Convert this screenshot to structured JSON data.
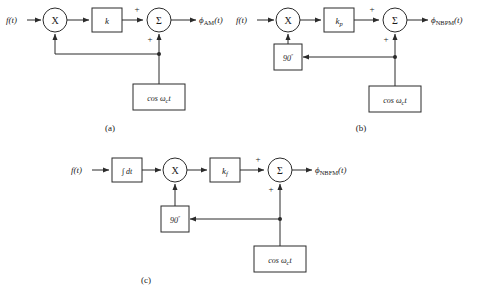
{
  "figure": {
    "type": "block-diagram-set",
    "stroke_color": "#2b2b2b",
    "background_color": "#ffffff"
  },
  "panels": [
    {
      "id": "a",
      "caption": "(a)",
      "name": "AM modulator",
      "input_label": "f(t)",
      "multiplier_label": "X",
      "gain_label": "k",
      "summer_label": "Σ",
      "sign_top": "+",
      "sign_bottom": "+",
      "carrier_label": "cos ωc t",
      "carrier_base": "cos ω",
      "carrier_sub": "c",
      "carrier_tail": "t",
      "output_label": "ϕNBPM(t)",
      "output_base": "ϕ",
      "output_sub": "AM",
      "output_tail": "(t)",
      "has_phase_shifter": false,
      "has_integrator": false
    },
    {
      "id": "b",
      "caption": "(b)",
      "name": "Narrowband PM modulator",
      "input_label": "f(t)",
      "multiplier_label": "X",
      "gain_base": "k",
      "gain_sub": "p",
      "summer_label": "Σ",
      "sign_top": "+",
      "sign_bottom": "+",
      "phase_shifter_label": "90º",
      "phase_shifter_value": "90",
      "phase_shifter_unit": "º",
      "carrier_base": "cos ω",
      "carrier_sub": "c",
      "carrier_tail": "t",
      "output_base": "ϕ",
      "output_sub": "NBPM",
      "output_tail": "(t)",
      "has_phase_shifter": true,
      "has_integrator": false
    },
    {
      "id": "c",
      "caption": "(c)",
      "name": "Narrowband FM modulator",
      "input_label": "f(t)",
      "integrator_label": "∫ dt",
      "multiplier_label": "X",
      "gain_base": "k",
      "gain_sub": "f",
      "summer_label": "Σ",
      "sign_top": "+",
      "sign_bottom": "+",
      "phase_shifter_value": "90",
      "phase_shifter_unit": "º",
      "carrier_base": "cos ω",
      "carrier_sub": "c",
      "carrier_tail": "t",
      "output_base": "ϕ",
      "output_sub": "NBFM",
      "output_tail": "(t)",
      "has_phase_shifter": true,
      "has_integrator": true
    }
  ]
}
